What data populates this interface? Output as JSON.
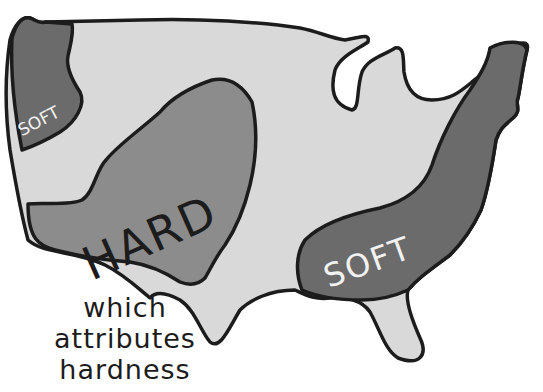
{
  "map": {
    "regions": [
      {
        "id": "pacific-northwest",
        "label": "SOFT",
        "fill": "#6b6b6b"
      },
      {
        "id": "central",
        "label": "HARD",
        "fill": "#8c8c8c"
      },
      {
        "id": "southeast",
        "label": "SOFT",
        "fill": "#6b6b6b"
      }
    ],
    "base_fill": "#d9d9d9",
    "outline_color": "#1c1c1c"
  },
  "caption": {
    "lines": [
      "which",
      "attributes",
      "hardness"
    ]
  }
}
